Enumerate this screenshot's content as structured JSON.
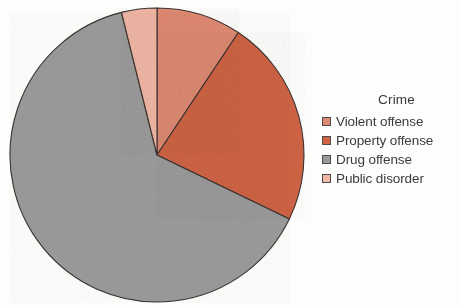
{
  "chart_data": {
    "type": "pie",
    "title": "",
    "legend_title": "Crime",
    "legend_position": "right",
    "categories": [
      "Violent offense",
      "Property offense",
      "Drug offense",
      "Public disorder"
    ],
    "values": [
      9.3,
      22.8,
      64.0,
      3.9
    ],
    "units": "percent",
    "start_angle_deg": 0,
    "direction": "clockwise",
    "slices": [
      {
        "label": "Violent offense",
        "value": 9.3,
        "color": "#e08a72",
        "start_deg": 0.0,
        "end_deg": 33.6
      },
      {
        "label": "Property offense",
        "value": 22.8,
        "color": "#cf6344",
        "start_deg": 33.6,
        "end_deg": 115.8
      },
      {
        "label": "Drug offense",
        "value": 64.0,
        "color": "#9a9a9a",
        "start_deg": 115.8,
        "end_deg": 346.0
      },
      {
        "label": "Public disorder",
        "value": 3.9,
        "color": "#f0b6a4",
        "start_deg": 346.0,
        "end_deg": 360.0
      }
    ],
    "geometry": {
      "center_x": 157,
      "center_y": 155,
      "radius": 147
    },
    "stroke_color": "#3c3230",
    "xlabel": "",
    "ylabel": ""
  },
  "legend": {
    "title": "Crime",
    "items": [
      {
        "label": "Violent offense",
        "color": "#e08a72"
      },
      {
        "label": "Property offense",
        "color": "#cf6344"
      },
      {
        "label": "Drug offense",
        "color": "#9a9a9a"
      },
      {
        "label": "Public disorder",
        "color": "#f0b6a4"
      }
    ]
  }
}
